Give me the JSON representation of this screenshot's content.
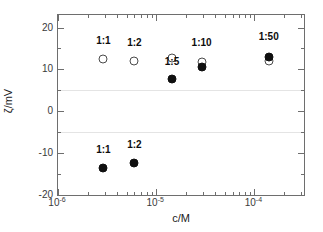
{
  "chart_data": {
    "type": "scatter",
    "title": "",
    "xlabel": "c/M",
    "ylabel": "ζ/mV",
    "xscale": "log",
    "xlim": [
      1e-06,
      0.00032
    ],
    "ylim": [
      -20,
      23
    ],
    "grid": "horizontal-faint-at-plus-minus-5",
    "legend": "none",
    "x_ticks": [
      {
        "value": 1e-06,
        "label_mantissa": "10",
        "label_exponent": "-6"
      },
      {
        "value": 1e-05,
        "label_mantissa": "10",
        "label_exponent": "-5"
      },
      {
        "value": 0.0001,
        "label_mantissa": "10",
        "label_exponent": "-4"
      }
    ],
    "y_ticks": [
      {
        "value": 20,
        "label": "20"
      },
      {
        "value": 10,
        "label": "10"
      },
      {
        "value": 0,
        "label": "0"
      },
      {
        "value": -10,
        "label": "-10"
      },
      {
        "value": -20,
        "label": "-20"
      }
    ],
    "y_minor_ticks": [
      15,
      5,
      -5,
      -15
    ],
    "gridlines_y": [
      5,
      -5
    ],
    "series": [
      {
        "name": "open-circle",
        "marker": "open",
        "points": [
          {
            "x": 2.9e-06,
            "y": 12.4,
            "label": "1:1"
          },
          {
            "x": 6e-06,
            "y": 11.9,
            "label": "1:2"
          },
          {
            "x": 1.45e-05,
            "y": 12.8,
            "label": "1:5"
          },
          {
            "x": 2.9e-05,
            "y": 11.7,
            "label": "1:10"
          },
          {
            "x": 0.00014,
            "y": 12.1,
            "label": "1:50"
          }
        ]
      },
      {
        "name": "filled-circle",
        "marker": "filled",
        "points": [
          {
            "x": 2.9e-06,
            "y": -13.5,
            "label": "1:1"
          },
          {
            "x": 6e-06,
            "y": -12.4,
            "label": "1:2"
          },
          {
            "x": 1.45e-05,
            "y": 7.8,
            "label": "1:5"
          },
          {
            "x": 2.9e-05,
            "y": 10.5,
            "label": "1:10"
          },
          {
            "x": 0.00014,
            "y": 13.0,
            "label": "1:50"
          }
        ]
      }
    ],
    "annotations": [
      {
        "text": "1:1",
        "x": 2.9e-06,
        "y": 15.6,
        "group": "upper"
      },
      {
        "text": "1:2",
        "x": 6e-06,
        "y": 15.1,
        "group": "upper"
      },
      {
        "text": "1:5",
        "x": 1.45e-05,
        "y": 10.5,
        "group": "upper"
      },
      {
        "text": "1:10",
        "x": 2.9e-05,
        "y": 15.0,
        "group": "upper"
      },
      {
        "text": "1:50",
        "x": 0.00014,
        "y": 16.5,
        "group": "upper"
      },
      {
        "text": "1:1",
        "x": 2.9e-06,
        "y": -10.4,
        "group": "lower"
      },
      {
        "text": "1:2",
        "x": 6e-06,
        "y": -9.2,
        "group": "lower"
      }
    ]
  },
  "colors": {
    "axis": "#6e6e6e",
    "gridline": "#e4e4e4",
    "filled_marker": "#101010",
    "open_marker_edge": "#4a4a4a",
    "text": "#1a1a1a",
    "background": "#ffffff"
  }
}
